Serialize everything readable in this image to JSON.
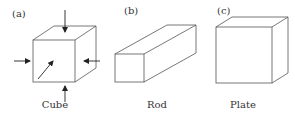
{
  "figure": {
    "panels": [
      {
        "id": "a",
        "tag": "(a)",
        "caption": "Cube",
        "arrows": 5
      },
      {
        "id": "b",
        "tag": "(b)",
        "caption": "Rod"
      },
      {
        "id": "c",
        "tag": "(c)",
        "caption": "Plate"
      }
    ],
    "colors": {
      "line": "#555555",
      "arrow": "#222222",
      "text": "#333333",
      "background": "#ffffff"
    }
  }
}
